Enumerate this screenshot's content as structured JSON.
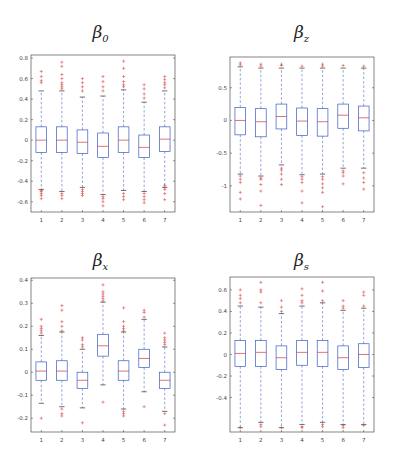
{
  "chart_data": [
    {
      "type": "box",
      "title": "β_0",
      "title_main": "β",
      "title_sub": "0",
      "xlabel": "",
      "ylabel": "",
      "categories": [
        "1",
        "2",
        "3",
        "4",
        "5",
        "6",
        "7"
      ],
      "ylim": [
        -0.7,
        0.83
      ],
      "yticks": [
        -0.6,
        -0.4,
        -0.2,
        0,
        0.2,
        0.4,
        0.6,
        0.8
      ],
      "ytick_labels": [
        "-0.6",
        "-0.4",
        "-0.2",
        "0",
        "0.2",
        "0.4",
        "0.6",
        "0.8"
      ],
      "grid": false,
      "boxes": [
        {
          "q1": -0.12,
          "median": 0.0,
          "q3": 0.13,
          "whisker_low": -0.48,
          "whisker_high": 0.48,
          "outliers": [
            0.56,
            0.58,
            0.62,
            0.67,
            -0.49,
            -0.5,
            -0.52,
            -0.54,
            -0.57
          ]
        },
        {
          "q1": -0.12,
          "median": 0.0,
          "q3": 0.13,
          "whisker_low": -0.5,
          "whisker_high": 0.48,
          "outliers": [
            0.5,
            0.52,
            0.54,
            0.56,
            0.6,
            0.64,
            0.72,
            0.76,
            -0.52,
            -0.54,
            -0.57
          ]
        },
        {
          "q1": -0.13,
          "median": -0.02,
          "q3": 0.1,
          "whisker_low": -0.46,
          "whisker_high": 0.42,
          "outliers": [
            0.48,
            0.52,
            0.56,
            0.6,
            -0.48,
            -0.5,
            -0.52,
            -0.54
          ]
        },
        {
          "q1": -0.17,
          "median": -0.06,
          "q3": 0.07,
          "whisker_low": -0.53,
          "whisker_high": 0.43,
          "outliers": [
            0.48,
            0.52,
            0.57,
            0.62,
            -0.55,
            -0.57,
            -0.6,
            -0.64
          ]
        },
        {
          "q1": -0.12,
          "median": 0.0,
          "q3": 0.13,
          "whisker_low": -0.49,
          "whisker_high": 0.49,
          "outliers": [
            0.52,
            0.54,
            0.57,
            0.62,
            0.7,
            0.77,
            -0.52,
            -0.55,
            -0.58
          ]
        },
        {
          "q1": -0.17,
          "median": -0.07,
          "q3": 0.05,
          "whisker_low": -0.5,
          "whisker_high": 0.37,
          "outliers": [
            0.41,
            0.45,
            0.5,
            0.54,
            -0.52,
            -0.55,
            -0.58,
            -0.61
          ]
        },
        {
          "q1": -0.11,
          "median": 0.01,
          "q3": 0.13,
          "whisker_low": -0.46,
          "whisker_high": 0.48,
          "outliers": [
            0.51,
            0.54,
            0.56,
            0.59,
            0.62,
            -0.44,
            -0.46,
            -0.48,
            -0.52,
            -0.58
          ]
        }
      ]
    },
    {
      "type": "box",
      "title": "β_z",
      "title_main": "β",
      "title_sub": "z",
      "xlabel": "",
      "ylabel": "",
      "categories": [
        "1",
        "2",
        "3",
        "4",
        "5",
        "6",
        "7"
      ],
      "ylim": [
        -1.4,
        0.97
      ],
      "yticks": [
        -1,
        -0.5,
        0,
        0.5
      ],
      "ytick_labels": [
        "-1",
        "-0.5",
        "0",
        "0.5"
      ],
      "grid": false,
      "boxes": [
        {
          "q1": -0.22,
          "median": 0.0,
          "q3": 0.2,
          "whisker_low": -0.82,
          "whisker_high": 0.82,
          "outliers": [
            0.85,
            0.88,
            -0.85,
            -0.9,
            -0.95,
            -1.1,
            -1.2
          ]
        },
        {
          "q1": -0.25,
          "median": -0.02,
          "q3": 0.18,
          "whisker_low": -0.85,
          "whisker_high": 0.8,
          "outliers": [
            0.83,
            0.86,
            -0.88,
            -0.9,
            -0.98,
            -1.08,
            -1.3
          ]
        },
        {
          "q1": -0.13,
          "median": 0.06,
          "q3": 0.25,
          "whisker_low": -0.68,
          "whisker_high": 0.8,
          "outliers": [
            0.84,
            0.86,
            -0.73,
            -0.76,
            -0.82,
            -0.9,
            -0.98
          ]
        },
        {
          "q1": -0.23,
          "median": -0.01,
          "q3": 0.19,
          "whisker_low": -0.83,
          "whisker_high": 0.8,
          "outliers": [
            0.83,
            -0.86,
            -0.9,
            -0.95,
            -1.08,
            -1.26
          ]
        },
        {
          "q1": -0.24,
          "median": -0.02,
          "q3": 0.18,
          "whisker_low": -0.82,
          "whisker_high": 0.8,
          "outliers": [
            0.83,
            0.86,
            -0.86,
            -0.9,
            -0.97,
            -1.03,
            -1.1,
            -1.32
          ]
        },
        {
          "q1": -0.12,
          "median": 0.08,
          "q3": 0.25,
          "whisker_low": -0.73,
          "whisker_high": 0.8,
          "outliers": [
            0.84,
            -0.77,
            -0.8,
            -0.85,
            -0.97
          ]
        },
        {
          "q1": -0.16,
          "median": 0.04,
          "q3": 0.22,
          "whisker_low": -0.73,
          "whisker_high": 0.8,
          "outliers": [
            0.83,
            -0.8,
            -0.88,
            -0.95,
            -1.05
          ]
        }
      ]
    },
    {
      "type": "box",
      "title": "β_x",
      "title_main": "β",
      "title_sub": "x",
      "xlabel": "",
      "ylabel": "",
      "categories": [
        "1",
        "2",
        "3",
        "4",
        "5",
        "6",
        "7"
      ],
      "ylim": [
        -0.26,
        0.41
      ],
      "yticks": [
        -0.2,
        -0.1,
        0,
        0.1,
        0.2,
        0.3,
        0.4
      ],
      "ytick_labels": [
        "-0.2",
        "-0.1",
        "0",
        "0.1",
        "0.2",
        "0.3",
        "0.4"
      ],
      "grid": false,
      "boxes": [
        {
          "q1": -0.035,
          "median": 0.005,
          "q3": 0.045,
          "whisker_low": -0.135,
          "whisker_high": 0.16,
          "outliers": [
            0.17,
            0.18,
            0.19,
            0.2,
            0.23,
            -0.2
          ]
        },
        {
          "q1": -0.035,
          "median": 0.005,
          "q3": 0.05,
          "whisker_low": -0.15,
          "whisker_high": 0.175,
          "outliers": [
            0.18,
            0.2,
            0.22,
            0.27,
            0.29,
            -0.16,
            -0.18,
            -0.19
          ]
        },
        {
          "q1": -0.07,
          "median": -0.035,
          "q3": 0.0,
          "whisker_low": -0.155,
          "whisker_high": 0.1,
          "outliers": [
            0.11,
            0.12,
            0.14,
            0.15,
            -0.22
          ]
        },
        {
          "q1": 0.07,
          "median": 0.115,
          "q3": 0.165,
          "whisker_low": -0.055,
          "whisker_high": 0.305,
          "outliers": [
            0.31,
            0.32,
            0.33,
            0.34,
            0.35,
            0.38,
            -0.13
          ]
        },
        {
          "q1": -0.035,
          "median": 0.005,
          "q3": 0.05,
          "whisker_low": -0.16,
          "whisker_high": 0.175,
          "outliers": [
            0.18,
            0.19,
            0.2,
            0.22,
            0.28,
            -0.17,
            -0.18,
            -0.19
          ]
        },
        {
          "q1": 0.02,
          "median": 0.06,
          "q3": 0.1,
          "whisker_low": -0.085,
          "whisker_high": 0.23,
          "outliers": [
            0.24,
            0.26,
            0.27,
            -0.15
          ]
        },
        {
          "q1": -0.07,
          "median": -0.035,
          "q3": 0.0,
          "whisker_low": -0.17,
          "whisker_high": 0.11,
          "outliers": [
            0.12,
            0.13,
            0.14,
            0.15,
            0.17,
            -0.18,
            -0.23
          ]
        }
      ]
    },
    {
      "type": "box",
      "title": "β_s",
      "title_main": "β",
      "title_sub": "s",
      "xlabel": "",
      "ylabel": "",
      "categories": [
        "1",
        "2",
        "3",
        "4",
        "5",
        "6",
        "7"
      ],
      "ylim": [
        -0.72,
        0.72
      ],
      "yticks": [
        -0.4,
        -0.2,
        0,
        0.2,
        0.4,
        0.6
      ],
      "ytick_labels": [
        "-0.4",
        "-0.2",
        "0",
        "0.2",
        "0.4",
        "0.6"
      ],
      "grid": false,
      "boxes": [
        {
          "q1": -0.11,
          "median": 0.01,
          "q3": 0.13,
          "whisker_low": -0.68,
          "whisker_high": 0.45,
          "outliers": [
            0.48,
            0.52,
            0.55,
            0.6,
            -0.68
          ]
        },
        {
          "q1": -0.11,
          "median": 0.02,
          "q3": 0.13,
          "whisker_low": -0.63,
          "whisker_high": 0.44,
          "outliers": [
            0.48,
            0.58,
            0.6,
            0.67,
            -0.65,
            -0.67
          ]
        },
        {
          "q1": -0.14,
          "median": -0.03,
          "q3": 0.08,
          "whisker_low": -0.68,
          "whisker_high": 0.38,
          "outliers": [
            0.4,
            0.44,
            0.5,
            -0.68
          ]
        },
        {
          "q1": -0.1,
          "median": 0.02,
          "q3": 0.13,
          "whisker_low": -0.65,
          "whisker_high": 0.45,
          "outliers": [
            0.48,
            0.5,
            0.55,
            0.61,
            -0.67,
            -0.68
          ]
        },
        {
          "q1": -0.11,
          "median": 0.02,
          "q3": 0.13,
          "whisker_low": -0.63,
          "whisker_high": 0.48,
          "outliers": [
            0.5,
            0.59,
            0.67,
            -0.65,
            -0.67
          ]
        },
        {
          "q1": -0.14,
          "median": -0.03,
          "q3": 0.08,
          "whisker_low": -0.65,
          "whisker_high": 0.41,
          "outliers": [
            0.43,
            0.45,
            0.5,
            -0.66,
            -0.68
          ]
        },
        {
          "q1": -0.12,
          "median": 0.0,
          "q3": 0.1,
          "whisker_low": -0.65,
          "whisker_high": 0.43,
          "outliers": [
            0.45,
            0.55,
            0.58,
            -0.66
          ]
        }
      ]
    }
  ],
  "panels": [
    {
      "title_main": "β",
      "title_sub": "0"
    },
    {
      "title_main": "β",
      "title_sub": "z"
    },
    {
      "title_main": "β",
      "title_sub": "x"
    },
    {
      "title_main": "β",
      "title_sub": "s"
    }
  ],
  "colors": {
    "box": "#3a5bbf",
    "median": "#d03a3a",
    "whisker": "#4a67c6",
    "outlier": "#d03a3a",
    "frame": "#333333"
  }
}
